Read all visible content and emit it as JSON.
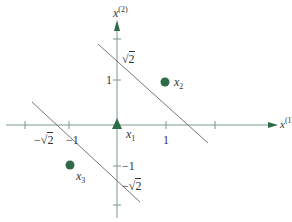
{
  "diagram": {
    "title": "",
    "colors": {
      "axis": "#7a9a8a",
      "line": "#777777",
      "point": "#2e6b47",
      "text": "#333333"
    },
    "axes": {
      "x_label_base": "x",
      "x_label_sup": "(1)",
      "y_label_base": "x",
      "y_label_sup": "(2)"
    },
    "ticks": {
      "x": [
        {
          "label": "−√2",
          "radicand": "2",
          "minus": "−"
        },
        {
          "label": "−1"
        },
        {
          "label": "1"
        }
      ],
      "y": [
        {
          "label": "√2",
          "radicand": "2"
        },
        {
          "label": "1"
        },
        {
          "label": "−1"
        },
        {
          "label": "−√2",
          "radicand": "2",
          "minus": "−"
        }
      ]
    },
    "points": [
      {
        "name": "x",
        "sub": "1",
        "shape": "triangle"
      },
      {
        "name": "x",
        "sub": "2",
        "shape": "circle"
      },
      {
        "name": "x",
        "sub": "3",
        "shape": "circle"
      }
    ],
    "lines": [
      {
        "description": "decision boundary upper-right, x1 + x2 = √2"
      },
      {
        "description": "decision boundary lower-left, x1 + x2 = −√2"
      }
    ]
  }
}
